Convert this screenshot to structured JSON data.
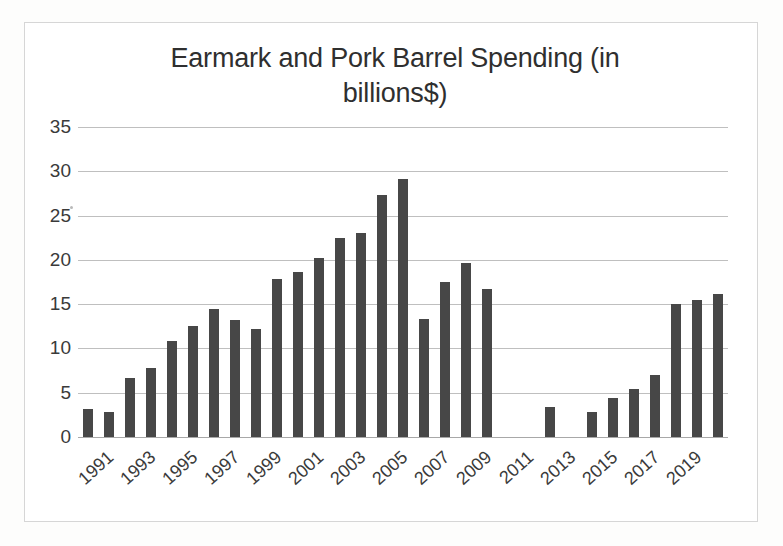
{
  "chart_data": {
    "type": "bar",
    "title": "Earmark and Pork Barrel Spending (in billions$)",
    "title_line1": "Earmark and Pork Barrel Spending (in",
    "title_line2": "billions$)",
    "xlabel": "",
    "ylabel": "",
    "ylim": [
      0,
      35
    ],
    "ytick_step": 5,
    "yticks": [
      0,
      5,
      10,
      15,
      20,
      25,
      30,
      35
    ],
    "ytick_labels": [
      "0",
      "5",
      "10",
      "15",
      "20",
      "25",
      "30",
      "35"
    ],
    "grid": true,
    "legend": "none",
    "bar_color": "#474747",
    "grid_color": "#bfbfbf",
    "categories": [
      "1991",
      "1992",
      "1993",
      "1994",
      "1995",
      "1996",
      "1997",
      "1998",
      "1999",
      "2000",
      "2001",
      "2002",
      "2003",
      "2004",
      "2005",
      "2006",
      "2007",
      "2008",
      "2009",
      "2010",
      "2011",
      "2012",
      "2013",
      "2014",
      "2015",
      "2016",
      "2017",
      "2018",
      "2019",
      "2020"
    ],
    "xtick_labels": [
      "1991",
      "1993",
      "1995",
      "1997",
      "1999",
      "2001",
      "2003",
      "2005",
      "2007",
      "2009",
      "2011",
      "2013",
      "2015",
      "2017",
      "2019"
    ],
    "values": [
      3.2,
      2.8,
      6.7,
      7.8,
      10.8,
      12.5,
      14.5,
      13.2,
      12.2,
      17.8,
      18.6,
      20.2,
      22.5,
      23.0,
      27.3,
      29.1,
      13.3,
      17.5,
      19.6,
      16.7,
      0,
      0,
      3.4,
      0,
      2.8,
      4.4,
      5.4,
      7.0,
      15.0,
      15.5
    ],
    "series": [
      {
        "name": "Earmark and Pork Barrel Spending",
        "values": [
          3.2,
          2.8,
          6.7,
          7.8,
          10.8,
          12.5,
          14.5,
          13.2,
          12.2,
          17.8,
          18.6,
          20.2,
          22.5,
          23.0,
          27.3,
          29.1,
          13.3,
          17.5,
          19.6,
          16.7,
          0,
          0,
          3.4,
          0,
          2.8,
          4.4,
          5.4,
          7.0,
          15.0,
          15.5
        ]
      }
    ],
    "extra_trailing_value": 16.2,
    "units": "billions of dollars"
  }
}
